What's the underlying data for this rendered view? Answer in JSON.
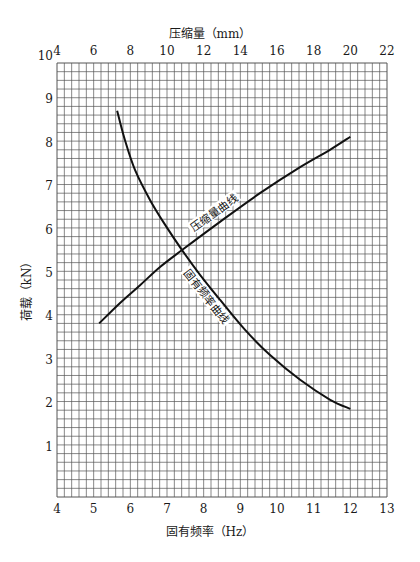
{
  "chart_data": {
    "type": "line",
    "title": "",
    "xlabel": "固有频率（Hz）",
    "x2label": "压缩量（mm）",
    "ylabel": "荷载（kN）",
    "xlim": [
      4,
      13
    ],
    "x2lim": [
      4,
      22
    ],
    "ylim": [
      0,
      10
    ],
    "x_ticks": [
      4,
      5,
      6,
      7,
      8,
      9,
      10,
      11,
      12,
      13
    ],
    "x2_ticks": [
      4,
      6,
      8,
      10,
      12,
      14,
      16,
      18,
      20,
      22
    ],
    "y_ticks": [
      1,
      2,
      3,
      4,
      5,
      6,
      7,
      8,
      9,
      10
    ],
    "grid": true,
    "grid_minor_divisions": 5,
    "series": [
      {
        "name": "固有频率曲线",
        "axis": "bottom",
        "x": [
          5.64,
          5.85,
          6.13,
          6.54,
          6.95,
          7.41,
          7.9,
          8.45,
          9.13,
          9.81,
          10.63,
          11.45,
          12.0
        ],
        "y": [
          8.9,
          8.23,
          7.53,
          6.84,
          6.27,
          5.69,
          5.12,
          4.54,
          3.85,
          3.27,
          2.7,
          2.24,
          2.03
        ]
      },
      {
        "name": "压缩量曲线",
        "axis": "top",
        "x": [
          6.3,
          7.44,
          8.53,
          9.62,
          10.82,
          12.89,
          15.07,
          17.26,
          18.89,
          20.0
        ],
        "y": [
          4.0,
          4.47,
          4.88,
          5.3,
          5.69,
          6.34,
          7.0,
          7.6,
          8.0,
          8.3
        ]
      }
    ],
    "annotations": [
      {
        "text": "压缩量曲线",
        "near_series": "压缩量曲线"
      },
      {
        "text": "固有频率曲线",
        "near_series": "固有频率曲线"
      }
    ]
  },
  "labels": {
    "top_axis_title": "压缩量（mm）",
    "bottom_axis_title": "固有频率（Hz）",
    "left_axis_title": "荷载（kN）",
    "curve_compression": "压缩量曲线",
    "curve_frequency": "固有频率曲线"
  },
  "colors": {
    "grid": "#555555",
    "curve": "#111111",
    "background": "#ffffff"
  }
}
